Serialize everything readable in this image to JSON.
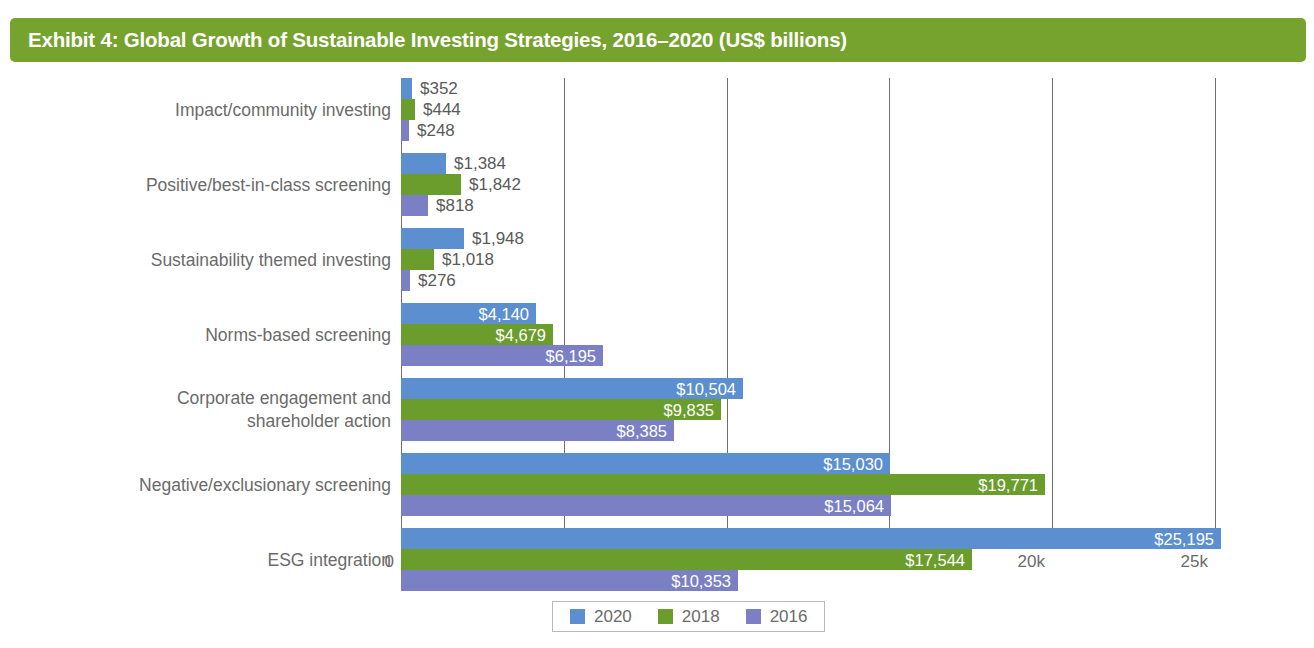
{
  "header": {
    "title": "Exhibit 4: Global Growth of Sustainable Investing Strategies, 2016–2020 (US$ billions)",
    "banner_color": "#76A22E"
  },
  "legend": {
    "position": "bottom-center",
    "items": [
      {
        "label": "2020",
        "color": "#5B8FD0"
      },
      {
        "label": "2018",
        "color": "#6B9D2C"
      },
      {
        "label": "2016",
        "color": "#7B7FC4"
      }
    ]
  },
  "axis": {
    "ticks": [
      "0",
      "5k",
      "10k",
      "15k",
      "20k",
      "25k"
    ],
    "tick_values": [
      0,
      5000,
      10000,
      15000,
      20000,
      25000
    ]
  },
  "chart_data": {
    "type": "bar",
    "orientation": "horizontal",
    "title": "Exhibit 4: Global Growth of Sustainable Investing Strategies, 2016–2020 (US$ billions)",
    "xlabel": "",
    "ylabel": "",
    "xlim": [
      0,
      25000
    ],
    "grid": true,
    "legend_position": "bottom-center",
    "categories": [
      "Impact/community investing",
      "Positive/best-in-class screening",
      "Sustainability themed investing",
      "Norms-based screening",
      "Corporate engagement and\nshareholder action",
      "Negative/exclusionary screening",
      "ESG integration"
    ],
    "series": [
      {
        "name": "2020",
        "color": "#5B8FD0",
        "values": [
          352,
          1384,
          1948,
          4140,
          10504,
          15030,
          25195
        ],
        "labels": [
          "$352",
          "$1,384",
          "$1,948",
          "$4,140",
          "$10,504",
          "$15,030",
          "$25,195"
        ]
      },
      {
        "name": "2018",
        "color": "#6B9D2C",
        "values": [
          444,
          1842,
          1018,
          4679,
          9835,
          19771,
          17544
        ],
        "labels": [
          "$444",
          "$1,842",
          "$1,018",
          "$4,679",
          "$9,835",
          "$19,771",
          "$17,544"
        ]
      },
      {
        "name": "2016",
        "color": "#7B7FC4",
        "values": [
          248,
          818,
          276,
          6195,
          8385,
          15064,
          10353
        ],
        "labels": [
          "$248",
          "$818",
          "$276",
          "$6,195",
          "$8,385",
          "$15,064",
          "$10,353"
        ]
      }
    ]
  }
}
